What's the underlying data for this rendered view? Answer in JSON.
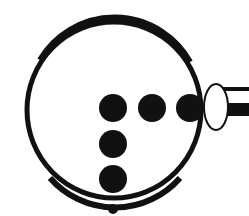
{
  "diagram": {
    "colors": {
      "ink": "#111111",
      "background": "#ffffff"
    },
    "circle": {
      "cx": 114,
      "cy": 110,
      "r": 86
    },
    "dots": [
      {
        "cx": 113,
        "cy": 108,
        "r": 14
      },
      {
        "cx": 152,
        "cy": 108,
        "r": 14
      },
      {
        "cx": 190,
        "cy": 108,
        "r": 14
      },
      {
        "cx": 113,
        "cy": 144,
        "r": 14
      },
      {
        "cx": 113,
        "cy": 179,
        "r": 14
      },
      {
        "cx": 113,
        "cy": 209,
        "r": 5
      }
    ],
    "ellipse": {
      "cx": 216,
      "cy": 107,
      "rx": 12,
      "ry": 23
    },
    "rod": {
      "x": 226,
      "top_line_y": 89,
      "bar_y": 103,
      "bar_h": 13
    }
  }
}
